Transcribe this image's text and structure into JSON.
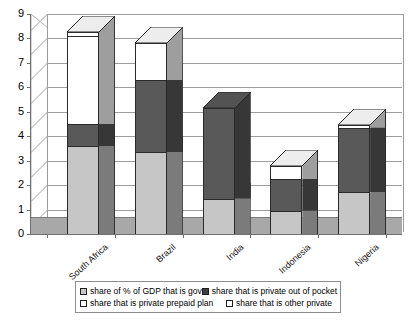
{
  "chart_data": {
    "type": "bar",
    "subtype": "stacked-column-3d",
    "title": "",
    "xlabel": "",
    "ylabel": "",
    "ylim": [
      0,
      9
    ],
    "ytick_step": 1,
    "yticks": [
      "9",
      "8",
      "7",
      "6",
      "5",
      "4",
      "3",
      "2",
      "1",
      "0"
    ],
    "grid": true,
    "legend_position": "bottom",
    "categories": [
      "South Africa",
      "Brazil",
      "India",
      "Indonesia",
      "Nigeria"
    ],
    "series": [
      {
        "name": "share of % of GDP that is gov",
        "color": "#c6c6c6",
        "values": [
          3.6,
          3.35,
          1.45,
          0.95,
          1.7
        ]
      },
      {
        "name": "share that is private out of pocket",
        "color": "#595959",
        "values": [
          0.9,
          2.95,
          3.7,
          1.3,
          2.65
        ]
      },
      {
        "name": "share that is private prepaid plan",
        "color": "#ffffff",
        "values": [
          3.6,
          1.5,
          0.0,
          0.55,
          0.1
        ]
      },
      {
        "name": "share that is other private",
        "color": "#ffffff",
        "values": [
          0.15,
          0.0,
          0.0,
          0.0,
          0.0
        ]
      }
    ],
    "totals": [
      8.25,
      7.8,
      5.15,
      2.8,
      4.45
    ]
  },
  "legend": {
    "items": [
      {
        "label": "share of % of GDP that is gov",
        "swatch": "#c6c6c6"
      },
      {
        "label": "share that is private out of pocket",
        "swatch": "#595959"
      },
      {
        "label": "share that is private prepaid plan",
        "swatch": "#ffffff"
      },
      {
        "label": "share that is other private",
        "swatch": "#ffffff"
      }
    ]
  },
  "colors": {
    "plot_background": "#ffffff",
    "floor": "#a8a8a8",
    "wall": "#ffffff",
    "gridline": "#9d9d9d",
    "axis": "#6f6f6f",
    "bar_outline": "#2a2a2a",
    "series_gov": "#c6c6c6",
    "series_out_of_pocket": "#595959",
    "series_prepaid": "#ffffff",
    "series_other": "#ffffff"
  }
}
